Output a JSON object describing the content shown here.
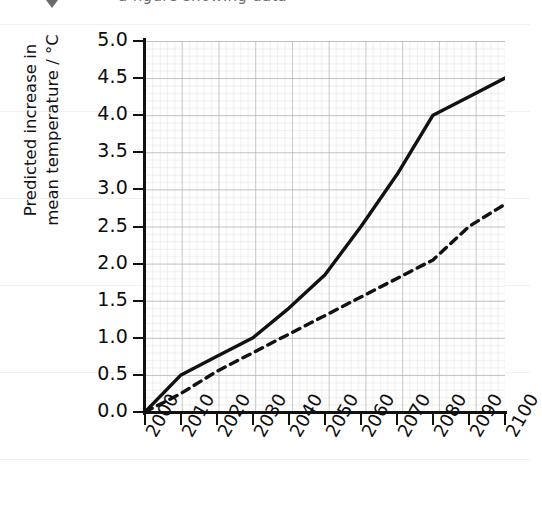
{
  "figure": {
    "cutoff_text": "a figure showing data",
    "marker_icon": "triangle-marker-icon"
  },
  "chart_data": {
    "type": "line",
    "title": "",
    "xlabel": "",
    "ylabel": "Predicted increase in\nmean temperature / °C",
    "xlim": [
      2000,
      2100
    ],
    "ylim": [
      0.0,
      5.0
    ],
    "grid": true,
    "grid_style": "graph-paper",
    "legend_position": "none",
    "x": [
      2000,
      2010,
      2020,
      2030,
      2040,
      2050,
      2060,
      2070,
      2080,
      2090,
      2100
    ],
    "xtick_labels": [
      "2000",
      "2010",
      "2020",
      "2030",
      "2040",
      "2050",
      "2060",
      "2070",
      "2080",
      "2090",
      "2100"
    ],
    "ytick_labels": [
      "0.0",
      "0.5",
      "1.0",
      "1.5",
      "2.0",
      "2.5",
      "3.0",
      "3.5",
      "4.0",
      "4.5",
      "5.0"
    ],
    "ytick_values": [
      0.0,
      0.5,
      1.0,
      1.5,
      2.0,
      2.5,
      3.0,
      3.5,
      4.0,
      4.5,
      5.0
    ],
    "series": [
      {
        "name": "Upper prediction",
        "style": "solid",
        "color": "#111111",
        "values": [
          0.0,
          0.5,
          0.75,
          1.0,
          1.4,
          1.85,
          2.5,
          3.2,
          4.0,
          4.25,
          4.5
        ]
      },
      {
        "name": "Lower prediction",
        "style": "dashed",
        "color": "#111111",
        "values": [
          0.0,
          0.25,
          0.55,
          0.8,
          1.05,
          1.3,
          1.55,
          1.8,
          2.05,
          2.5,
          2.8
        ]
      }
    ]
  },
  "colors": {
    "ink": "#111111",
    "grid_minor": "#d8d8d8",
    "grid_major": "#b4b4b4",
    "paper": "#ffffff"
  }
}
